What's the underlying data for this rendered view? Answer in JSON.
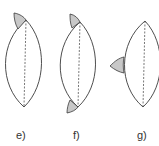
{
  "figures": [
    {
      "id": "e",
      "label": "e)",
      "description": "Lens shape with shaded cap attached at top, offset to the left"
    },
    {
      "id": "f",
      "label": "f)",
      "description": "Lens shape with shaded caps attached at top and bottom, offset to the left"
    },
    {
      "id": "g",
      "label": "g)",
      "description": "Lens shape with shaded wedge attached on the left side at mid-height"
    }
  ],
  "colors": {
    "outline": "#3a3a3a",
    "shading": "#c8c8c8",
    "background": "#ffffff"
  }
}
